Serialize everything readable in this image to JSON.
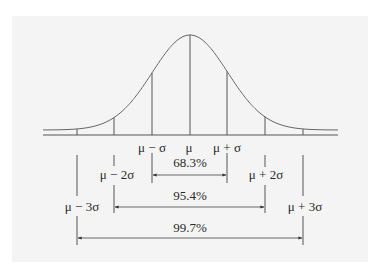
{
  "diagram": {
    "background_color": "#f4f4f4",
    "line_color": "#555555",
    "text_color": "#2a2a2a",
    "curve": {
      "type": "gaussian",
      "mean_x": 190,
      "sigma_px": 37.7,
      "baseline_y": 135,
      "peak_y": 35,
      "x_start": 43,
      "x_end": 338
    },
    "marks": [
      {
        "id": "m-3s",
        "label": "μ − 3σ",
        "x": 77
      },
      {
        "id": "m-2s",
        "label": "μ − 2σ",
        "x": 114
      },
      {
        "id": "m-1s",
        "label": "μ − σ",
        "x": 152
      },
      {
        "id": "mu",
        "label": "μ",
        "x": 190
      },
      {
        "id": "p-1s",
        "label": "μ + σ",
        "x": 227
      },
      {
        "id": "p-2s",
        "label": "μ + 2σ",
        "x": 265
      },
      {
        "id": "p-3s",
        "label": "μ + 3σ",
        "x": 303
      }
    ],
    "intervals": [
      {
        "id": "one-sigma",
        "label": "68.3%",
        "from": "μ − σ",
        "to": "μ + σ"
      },
      {
        "id": "two-sigma",
        "label": "95.4%",
        "from": "μ − 2σ",
        "to": "μ + 2σ"
      },
      {
        "id": "three-sigma",
        "label": "99.7%",
        "from": "μ − 3σ",
        "to": "μ + 3σ"
      }
    ]
  }
}
